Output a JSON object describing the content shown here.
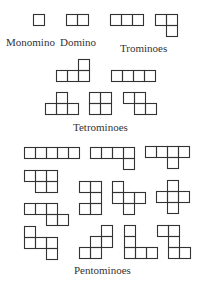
{
  "cell_size": 11,
  "stroke_color": "#333333",
  "labels": [
    {
      "id": "monomino",
      "text": "Monomino",
      "x": 6,
      "y": 37
    },
    {
      "id": "domino",
      "text": "Domino",
      "x": 60,
      "y": 37
    },
    {
      "id": "trominoes",
      "text": "Trominoes",
      "x": 120,
      "y": 43
    },
    {
      "id": "tetrominoes",
      "text": "Tetrominoes",
      "x": 73,
      "y": 122
    },
    {
      "id": "pentominoes",
      "text": "Pentominoes",
      "x": 74,
      "y": 265
    }
  ],
  "groups": [
    {
      "name": "Monomino",
      "pieces": [
        {
          "id": "monomino",
          "x": 33,
          "y": 14,
          "cells": [
            [
              0,
              0
            ]
          ]
        }
      ]
    },
    {
      "name": "Domino",
      "pieces": [
        {
          "id": "domino",
          "x": 66,
          "y": 14,
          "cells": [
            [
              0,
              0
            ],
            [
              1,
              0
            ]
          ]
        }
      ]
    },
    {
      "name": "Trominoes",
      "pieces": [
        {
          "id": "tromino-i",
          "x": 110,
          "y": 14,
          "cells": [
            [
              0,
              0
            ],
            [
              1,
              0
            ],
            [
              2,
              0
            ]
          ]
        },
        {
          "id": "tromino-l",
          "x": 155,
          "y": 14,
          "cells": [
            [
              0,
              0
            ],
            [
              1,
              0
            ],
            [
              1,
              1
            ]
          ]
        }
      ]
    },
    {
      "name": "Tetrominoes",
      "pieces": [
        {
          "id": "tetromino-l",
          "x": 56,
          "y": 59,
          "cells": [
            [
              2,
              0
            ],
            [
              0,
              1
            ],
            [
              1,
              1
            ],
            [
              2,
              1
            ]
          ]
        },
        {
          "id": "tetromino-i",
          "x": 111,
          "y": 70,
          "cells": [
            [
              0,
              0
            ],
            [
              1,
              0
            ],
            [
              2,
              0
            ],
            [
              3,
              0
            ]
          ]
        },
        {
          "id": "tetromino-t",
          "x": 45,
          "y": 92,
          "cells": [
            [
              1,
              0
            ],
            [
              0,
              1
            ],
            [
              1,
              1
            ],
            [
              2,
              1
            ]
          ]
        },
        {
          "id": "tetromino-o",
          "x": 89,
          "y": 92,
          "cells": [
            [
              0,
              0
            ],
            [
              1,
              0
            ],
            [
              0,
              1
            ],
            [
              1,
              1
            ]
          ]
        },
        {
          "id": "tetromino-z",
          "x": 123,
          "y": 92,
          "cells": [
            [
              0,
              0
            ],
            [
              1,
              0
            ],
            [
              1,
              1
            ],
            [
              2,
              1
            ]
          ]
        }
      ]
    },
    {
      "name": "Pentominoes",
      "pieces": [
        {
          "id": "pentomino-i",
          "x": 24,
          "y": 147,
          "cells": [
            [
              0,
              0
            ],
            [
              1,
              0
            ],
            [
              2,
              0
            ],
            [
              3,
              0
            ],
            [
              4,
              0
            ]
          ]
        },
        {
          "id": "pentomino-l",
          "x": 90,
          "y": 147,
          "cells": [
            [
              0,
              0
            ],
            [
              1,
              0
            ],
            [
              2,
              0
            ],
            [
              3,
              0
            ],
            [
              3,
              1
            ]
          ]
        },
        {
          "id": "pentomino-y",
          "x": 145,
          "y": 146,
          "cells": [
            [
              0,
              0
            ],
            [
              1,
              0
            ],
            [
              2,
              0
            ],
            [
              3,
              0
            ],
            [
              2,
              1
            ]
          ]
        },
        {
          "id": "pentomino-p",
          "x": 24,
          "y": 170,
          "cells": [
            [
              0,
              0
            ],
            [
              1,
              0
            ],
            [
              2,
              0
            ],
            [
              1,
              1
            ],
            [
              2,
              1
            ]
          ]
        },
        {
          "id": "pentomino-u",
          "x": 79,
          "y": 181,
          "cells": [
            [
              0,
              0
            ],
            [
              1,
              0
            ],
            [
              1,
              1
            ],
            [
              0,
              2
            ],
            [
              1,
              2
            ]
          ]
        },
        {
          "id": "pentomino-f",
          "x": 112,
          "y": 181,
          "cells": [
            [
              0,
              0
            ],
            [
              0,
              1
            ],
            [
              1,
              1
            ],
            [
              2,
              1
            ],
            [
              1,
              2
            ]
          ]
        },
        {
          "id": "pentomino-x",
          "x": 156,
          "y": 180,
          "cells": [
            [
              1,
              0
            ],
            [
              0,
              1
            ],
            [
              1,
              1
            ],
            [
              2,
              1
            ],
            [
              1,
              2
            ]
          ]
        },
        {
          "id": "pentomino-n",
          "x": 24,
          "y": 203,
          "cells": [
            [
              0,
              0
            ],
            [
              1,
              0
            ],
            [
              2,
              0
            ],
            [
              2,
              1
            ],
            [
              3,
              1
            ]
          ]
        },
        {
          "id": "pentomino-z",
          "x": 24,
          "y": 226,
          "cells": [
            [
              0,
              0
            ],
            [
              0,
              1
            ],
            [
              1,
              1
            ],
            [
              2,
              1
            ],
            [
              2,
              2
            ]
          ]
        },
        {
          "id": "pentomino-w",
          "x": 79,
          "y": 225,
          "cells": [
            [
              2,
              0
            ],
            [
              1,
              1
            ],
            [
              2,
              1
            ],
            [
              0,
              2
            ],
            [
              1,
              2
            ]
          ]
        },
        {
          "id": "pentomino-v",
          "x": 124,
          "y": 225,
          "cells": [
            [
              0,
              0
            ],
            [
              0,
              1
            ],
            [
              0,
              2
            ],
            [
              1,
              2
            ],
            [
              2,
              2
            ]
          ]
        },
        {
          "id": "pentomino-s",
          "x": 157,
          "y": 225,
          "cells": [
            [
              0,
              0
            ],
            [
              1,
              0
            ],
            [
              1,
              1
            ],
            [
              1,
              2
            ],
            [
              2,
              2
            ]
          ]
        }
      ]
    }
  ]
}
